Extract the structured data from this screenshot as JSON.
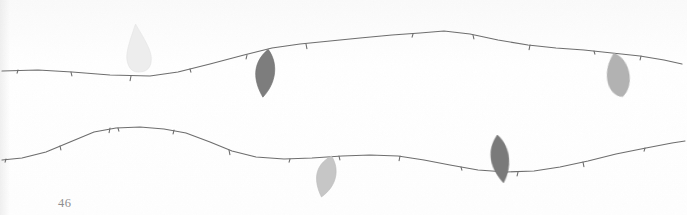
{
  "page": {
    "kind": "scanned-book-page",
    "page_number": "46",
    "background_color": "#fefefe",
    "width": 687,
    "height": 215
  },
  "artwork": {
    "title": "",
    "description": "Two thin horizontal branches with small buds and five hanging leaves",
    "ink_color": "#6f6f6f",
    "branches": [
      {
        "name": "upper-branch",
        "stroke": "#6e6e6e",
        "stroke_width": 1.2,
        "path": "M 2 71 L 38 70 L 72 72 L 110 75 L 150 76 L 178 72 L 210 64 L 244 55 L 272 48 L 300 44 L 330 41 L 360 38 L 392 35 L 420 33 L 444 31 L 470 34 L 498 40 L 528 45 L 556 48 L 584 50 L 612 53 L 640 56 L 664 60 L 682 64",
        "buds": [
          {
            "x": 18,
            "y": 70
          },
          {
            "x": 71,
            "y": 72
          },
          {
            "x": 131,
            "y": 76
          },
          {
            "x": 190,
            "y": 69
          },
          {
            "x": 247,
            "y": 55
          },
          {
            "x": 306,
            "y": 44
          },
          {
            "x": 413,
            "y": 34
          },
          {
            "x": 473,
            "y": 35
          },
          {
            "x": 530,
            "y": 45
          },
          {
            "x": 594,
            "y": 51
          },
          {
            "x": 641,
            "y": 56
          }
        ]
      },
      {
        "name": "lower-branch",
        "stroke": "#6e6e6e",
        "stroke_width": 1.2,
        "path": "M 2 160 L 22 158 L 46 152 L 70 142 L 94 132 L 116 128 L 140 127 L 164 129 L 186 133 L 210 142 L 232 151 L 256 157 L 284 159 L 312 158 L 342 156 L 370 155 L 398 156 L 424 160 L 450 165 L 478 170 L 506 172 L 534 171 L 560 167 L 588 161 L 616 154 L 646 148 L 672 143 L 685 141",
        "buds": [
          {
            "x": 6,
            "y": 159
          },
          {
            "x": 60,
            "y": 146
          },
          {
            "x": 110,
            "y": 128
          },
          {
            "x": 118,
            "y": 128
          },
          {
            "x": 174,
            "y": 130
          },
          {
            "x": 229,
            "y": 150
          },
          {
            "x": 290,
            "y": 159
          },
          {
            "x": 339,
            "y": 156
          },
          {
            "x": 400,
            "y": 156
          },
          {
            "x": 461,
            "y": 167
          },
          {
            "x": 518,
            "y": 172
          },
          {
            "x": 583,
            "y": 162
          },
          {
            "x": 645,
            "y": 148
          }
        ]
      }
    ],
    "leaves": [
      {
        "name": "leaf-pale-upper-left",
        "color": "#ededed",
        "stroke": "#e2e2e2",
        "cx": 138,
        "cy": 48,
        "width": 26,
        "height": 48,
        "rotation": -6,
        "shape": "teardrop",
        "attached_to": "upper-branch"
      },
      {
        "name": "leaf-dark-upper-mid",
        "color": "#7d7d7d",
        "stroke": "#6d6d6d",
        "cx": 264,
        "cy": 73,
        "width": 28,
        "height": 48,
        "rotation": 10,
        "shape": "pointed-oval",
        "attached_to": "upper-branch"
      },
      {
        "name": "leaf-gray-upper-right",
        "color": "#b2b2b2",
        "stroke": "#a6a6a6",
        "cx": 617,
        "cy": 75,
        "width": 30,
        "height": 44,
        "rotation": -8,
        "shape": "rounded-oval",
        "attached_to": "upper-branch"
      },
      {
        "name": "leaf-light-lower-left",
        "color": "#c6c6c6",
        "stroke": "#bbbbbb",
        "cx": 325,
        "cy": 176,
        "width": 28,
        "height": 42,
        "rotation": 18,
        "shape": "pointed-oval",
        "attached_to": "lower-branch"
      },
      {
        "name": "leaf-dark-lower-right",
        "color": "#7a7a7a",
        "stroke": "#6b6b6b",
        "cx": 499,
        "cy": 159,
        "width": 26,
        "height": 48,
        "rotation": -4,
        "shape": "pointed-oval",
        "attached_to": "lower-branch"
      }
    ]
  }
}
